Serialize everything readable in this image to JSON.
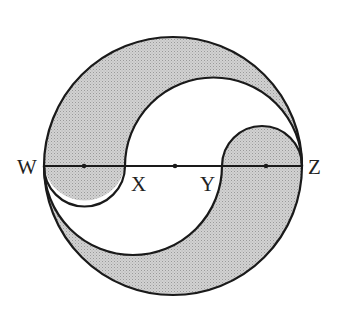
{
  "diagram": {
    "type": "geometry",
    "labels": {
      "w": "W",
      "x": "X",
      "y": "Y",
      "z": "Z"
    },
    "colors": {
      "shade": "#c8c8c8",
      "stroke": "#1a1a1a",
      "background": "#ffffff"
    }
  }
}
